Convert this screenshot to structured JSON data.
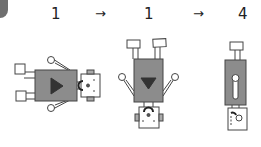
{
  "sequence": {
    "steps": [
      {
        "label": "1"
      },
      {
        "label": "1"
      },
      {
        "label": "4"
      }
    ],
    "arrow_glyph": "→"
  },
  "figures": [
    {
      "name": "robot-lying-horizontal",
      "symbol": "play-triangle"
    },
    {
      "name": "robot-upside-down",
      "symbol": "down-triangle"
    },
    {
      "name": "robot-side-view",
      "symbol": "slot-keyhole"
    }
  ],
  "colors": {
    "body": "#8c8c8c",
    "symbol": "#333333",
    "outline": "#444444",
    "corner": "#6f6f6f"
  }
}
